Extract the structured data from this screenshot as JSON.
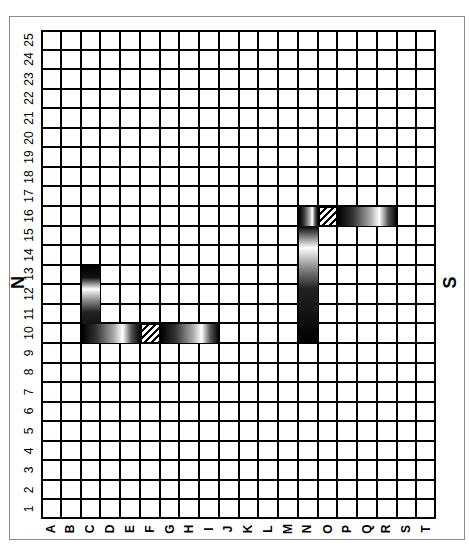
{
  "diagram": {
    "compass": {
      "north": "N",
      "south": "S"
    },
    "rows": [
      "1",
      "2",
      "3",
      "4",
      "5",
      "6",
      "7",
      "8",
      "9",
      "10",
      "11",
      "12",
      "13",
      "14",
      "15",
      "16",
      "17",
      "18",
      "19",
      "20",
      "21",
      "22",
      "23",
      "24",
      "25"
    ],
    "columns": [
      "A",
      "B",
      "C",
      "D",
      "E",
      "F",
      "G",
      "H",
      "I",
      "J",
      "K",
      "L",
      "M",
      "N",
      "O",
      "P",
      "Q",
      "R",
      "S",
      "T"
    ],
    "segments": [
      {
        "id": "segment-c-vertical",
        "orientation": "vertical",
        "column": "C",
        "rows": [
          10,
          13
        ],
        "style": "shaded"
      },
      {
        "id": "segment-row10-horizontal",
        "orientation": "horizontal",
        "row": 10,
        "columns": [
          "C",
          "I"
        ],
        "style": "shaded",
        "hatched_cell": "F10"
      },
      {
        "id": "segment-n-vertical",
        "orientation": "vertical",
        "column": "N",
        "rows": [
          10,
          16
        ],
        "style": "shaded"
      },
      {
        "id": "segment-row16-horizontal",
        "orientation": "horizontal",
        "row": 16,
        "columns": [
          "N",
          "R"
        ],
        "style": "shaded",
        "hatched_cell": "O16"
      }
    ],
    "colors": {
      "grid": "#000000",
      "frame": "#8a8a8a",
      "fill": "#000000",
      "background": "#ffffff"
    }
  }
}
